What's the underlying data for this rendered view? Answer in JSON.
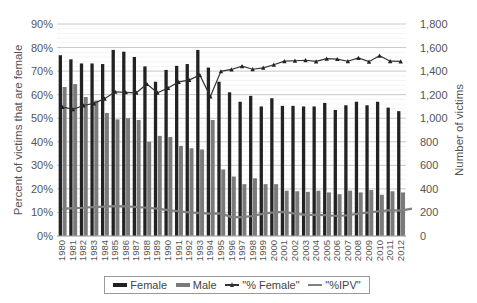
{
  "chart_data": {
    "type": "bar",
    "title": "",
    "xlabel": "",
    "ylabel": "Percent of victims that are female",
    "y2label": "Number of victims",
    "ylim": [
      0,
      90
    ],
    "y2lim": [
      0,
      1800
    ],
    "yticks": [
      "0%",
      "10%",
      "20%",
      "30%",
      "40%",
      "50%",
      "60%",
      "70%",
      "80%",
      "90%"
    ],
    "y2ticks": [
      "0",
      "200",
      "400",
      "600",
      "800",
      "1,000",
      "1,200",
      "1,400",
      "1,600",
      "1,800"
    ],
    "grid": true,
    "legend_position": "bottom",
    "categories": [
      "1980",
      "1981",
      "1982",
      "1983",
      "1984",
      "1985",
      "1986",
      "1987",
      "1988",
      "1989",
      "1990",
      "1991",
      "1992",
      "1993",
      "1994",
      "1995",
      "1996",
      "1997",
      "1998",
      "1999",
      "2000",
      "2001",
      "2002",
      "2003",
      "2004",
      "2005",
      "2006",
      "2007",
      "2008",
      "2009",
      "2010",
      "2011",
      "2012"
    ],
    "series": [
      {
        "name": "Female",
        "type": "bar",
        "axis": "right",
        "color": "#222222",
        "values": [
          1535,
          1500,
          1465,
          1465,
          1460,
          1580,
          1565,
          1520,
          1440,
          1310,
          1410,
          1445,
          1460,
          1580,
          1430,
          1310,
          1220,
          1140,
          1190,
          1100,
          1170,
          1105,
          1105,
          1100,
          1100,
          1130,
          1070,
          1110,
          1140,
          1110,
          1140,
          1090,
          1060
        ]
      },
      {
        "name": "Male",
        "type": "bar",
        "axis": "right",
        "color": "#7a7a7a",
        "values": [
          1265,
          1290,
          1180,
          1150,
          1045,
          990,
          1000,
          985,
          800,
          850,
          840,
          765,
          745,
          735,
          985,
          565,
          505,
          440,
          490,
          440,
          440,
          385,
          380,
          375,
          385,
          370,
          355,
          385,
          370,
          390,
          350,
          380,
          370
        ]
      },
      {
        "name": "\"% Female\"",
        "type": "line",
        "axis": "left",
        "color": "#333333",
        "marker": "triangle",
        "values": [
          54.8,
          53.8,
          55.4,
          56.3,
          58.3,
          61.2,
          61.0,
          60.8,
          64.5,
          60.8,
          62.8,
          65.4,
          66.2,
          68.4,
          59.2,
          69.9,
          70.7,
          72.1,
          70.8,
          71.4,
          72.7,
          74.2,
          74.4,
          74.6,
          74.1,
          75.3,
          75.1,
          74.2,
          75.6,
          74.0,
          76.5,
          74.2,
          74.1
        ]
      },
      {
        "name": "\"%IPV\"",
        "type": "line",
        "axis": "left",
        "color": "#808080",
        "marker": "none",
        "values": [
          11.5,
          11.8,
          12.0,
          12.3,
          12.5,
          12.7,
          12.6,
          12.3,
          12.0,
          11.6,
          11.0,
          10.5,
          10.0,
          9.7,
          9.5,
          9.6,
          8.0,
          8.0,
          8.5,
          9.5,
          10.0,
          10.2,
          9.5,
          9.0,
          9.0,
          8.8,
          8.5,
          8.8,
          9.5,
          10.0,
          10.5,
          11.0,
          10.8
        ]
      }
    ]
  },
  "legend": {
    "female": "Female",
    "male": "Male",
    "pct_female": "\"% Female\"",
    "pct_ipv": "\"%IPV\""
  }
}
